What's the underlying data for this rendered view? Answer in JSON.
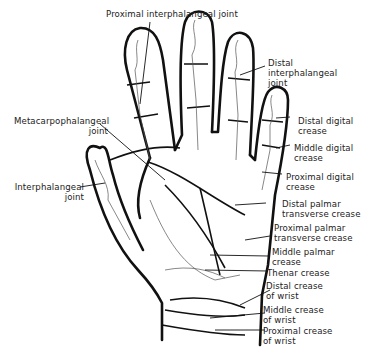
{
  "diagram": {
    "ink_color": "#111111",
    "bone_color": "#555555",
    "labels": {
      "proximal_interphalangeal_joint": "Proximal interphalangeal joint",
      "distal_interphalangeal_joint_1": "Distal",
      "distal_interphalangeal_joint_2": "interphalangeal",
      "distal_interphalangeal_joint_3": "joint",
      "distal_digital_crease_1": "Distal digital",
      "distal_digital_crease_2": "crease",
      "middle_digital_crease_1": "Middle digital",
      "middle_digital_crease_2": "crease",
      "proximal_digital_crease_1": "Proximal digital",
      "proximal_digital_crease_2": "crease",
      "distal_palmar_transverse_crease_1": "Distal palmar",
      "distal_palmar_transverse_crease_2": "transverse crease",
      "proximal_palmar_transverse_crease_1": "Proximal palmar",
      "proximal_palmar_transverse_crease_2": "transverse crease",
      "middle_palmar_crease_1": "Middle palmar",
      "middle_palmar_crease_2": "crease",
      "thenar_crease": "Thenar crease",
      "distal_crease_of_wrist_1": "Distal crease",
      "distal_crease_of_wrist_2": "of wrist",
      "middle_crease_of_wrist_1": "Middle crease",
      "middle_crease_of_wrist_2": "of wrist",
      "proximal_crease_of_wrist_1": "Proximal crease",
      "proximal_crease_of_wrist_2": "of wrist",
      "metacarpophalangeal_joint_1": "Metacarpophalangeal",
      "metacarpophalangeal_joint_2": "joint",
      "interphalangeal_joint_1": "Interphalangeal",
      "interphalangeal_joint_2": "joint"
    }
  }
}
